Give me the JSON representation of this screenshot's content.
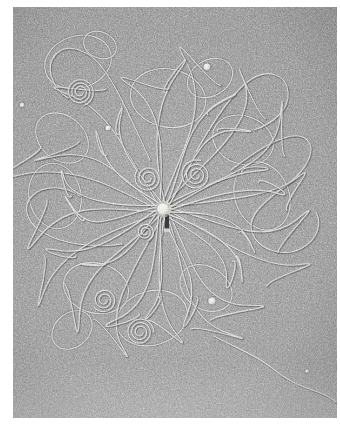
{
  "image": {
    "kind": "transmission-electron-micrograph",
    "subject": "bacteriophage with released DNA",
    "caption": "",
    "width_px": 340,
    "height_px": 426
  },
  "frame": {
    "border_color": "#ffffff",
    "border_left_px": 13,
    "border_top_px": 7,
    "border_right_px": 3,
    "border_bottom_px": 8
  },
  "micrograph": {
    "background_base_color": "#8d8d8d",
    "background_dark_color": "#3a3a3a",
    "background_light_color": "#d8d8d8",
    "filament_color": "#e8e8e8",
    "filament_shadow_color": "#2e2e2e",
    "grain_description": "fine high-contrast stain granularity over carbon support film",
    "vignette_note": "upper-left slightly darker, lower edge slightly lighter"
  },
  "capsid": {
    "label": "phage head",
    "center_x": 163,
    "center_y": 209,
    "radius_px": 6,
    "fill_color": "#f2f0ea",
    "halo_color": "#cfcdc6"
  },
  "tail": {
    "label": "phage tail",
    "x": 167,
    "y_top": 214,
    "y_bottom": 231,
    "width_px": 4,
    "color": "#232323",
    "baseplate_y": 231
  },
  "beads": [
    {
      "name": "latex-bead-upper-right",
      "cx": 207,
      "cy": 67,
      "r": 3.4,
      "color": "#f0eee8"
    },
    {
      "name": "latex-bead-mid-left",
      "cx": 108,
      "cy": 128,
      "r": 2.6,
      "color": "#e8e6e0"
    },
    {
      "name": "latex-bead-lower-right",
      "cx": 212,
      "cy": 301,
      "r": 3.6,
      "color": "#efede6"
    },
    {
      "name": "latex-bead-far-left",
      "cx": 22,
      "cy": 105,
      "r": 2.2,
      "color": "#dedcd6"
    },
    {
      "name": "speck-bottom-right",
      "cx": 307,
      "cy": 371,
      "r": 1.8,
      "color": "#e2e0da"
    }
  ],
  "dna": {
    "label": "released double-stranded DNA",
    "strand_width_px": 1.15,
    "strand_count": 44,
    "description": "long duplex fibres radiating from the capsid, forming open loops, sweeping arcs and tight coils",
    "radial_strands": [
      {
        "a": 268,
        "len": 150,
        "curl": 58,
        "wob": 16
      },
      {
        "a": 282,
        "len": 131,
        "curl": -44,
        "wob": 13
      },
      {
        "a": 294,
        "len": 160,
        "curl": 62,
        "wob": 18
      },
      {
        "a": 305,
        "len": 118,
        "curl": -36,
        "wob": 11
      },
      {
        "a": 315,
        "len": 147,
        "curl": 50,
        "wob": 15
      },
      {
        "a": 326,
        "len": 108,
        "curl": -52,
        "wob": 12
      },
      {
        "a": 337,
        "len": 140,
        "curl": 40,
        "wob": 14
      },
      {
        "a": 348,
        "len": 96,
        "curl": -30,
        "wob": 10
      },
      {
        "a": 357,
        "len": 128,
        "curl": 55,
        "wob": 16
      },
      {
        "a": 6,
        "len": 112,
        "curl": -46,
        "wob": 12
      },
      {
        "a": 16,
        "len": 152,
        "curl": 48,
        "wob": 17
      },
      {
        "a": 27,
        "len": 90,
        "curl": -34,
        "wob": 10
      },
      {
        "a": 37,
        "len": 126,
        "curl": 60,
        "wob": 15
      },
      {
        "a": 47,
        "len": 104,
        "curl": -42,
        "wob": 12
      },
      {
        "a": 57,
        "len": 138,
        "curl": 44,
        "wob": 16
      },
      {
        "a": 67,
        "len": 86,
        "curl": -56,
        "wob": 11
      },
      {
        "a": 77,
        "len": 120,
        "curl": 38,
        "wob": 13
      },
      {
        "a": 87,
        "len": 100,
        "curl": -48,
        "wob": 12
      },
      {
        "a": 97,
        "len": 142,
        "curl": 52,
        "wob": 17
      },
      {
        "a": 108,
        "len": 94,
        "curl": -32,
        "wob": 10
      },
      {
        "a": 118,
        "len": 130,
        "curl": 46,
        "wob": 15
      },
      {
        "a": 128,
        "len": 110,
        "curl": -58,
        "wob": 13
      },
      {
        "a": 139,
        "len": 148,
        "curl": 42,
        "wob": 16
      },
      {
        "a": 150,
        "len": 88,
        "curl": -38,
        "wob": 10
      },
      {
        "a": 160,
        "len": 124,
        "curl": 54,
        "wob": 14
      },
      {
        "a": 171,
        "len": 102,
        "curl": -44,
        "wob": 12
      },
      {
        "a": 182,
        "len": 136,
        "curl": 48,
        "wob": 16
      },
      {
        "a": 193,
        "len": 92,
        "curl": -50,
        "wob": 11
      },
      {
        "a": 203,
        "len": 118,
        "curl": 36,
        "wob": 13
      },
      {
        "a": 214,
        "len": 106,
        "curl": -54,
        "wob": 12
      },
      {
        "a": 224,
        "len": 144,
        "curl": 50,
        "wob": 17
      },
      {
        "a": 234,
        "len": 84,
        "curl": -30,
        "wob": 10
      },
      {
        "a": 244,
        "len": 122,
        "curl": 58,
        "wob": 14
      },
      {
        "a": 255,
        "len": 98,
        "curl": -40,
        "wob": 11
      }
    ],
    "coils": [
      {
        "name": "coil-upper-left",
        "cx": 80,
        "cy": 92,
        "r0": 3,
        "turns": 3.2,
        "grow": 3.4
      },
      {
        "name": "coil-upper-mid",
        "cx": 148,
        "cy": 178,
        "r0": 3,
        "turns": 2.6,
        "grow": 4.0
      },
      {
        "name": "coil-right-of-head",
        "cx": 196,
        "cy": 175,
        "r0": 3,
        "turns": 2.8,
        "grow": 4.4
      },
      {
        "name": "coil-left-lower",
        "cx": 104,
        "cy": 300,
        "r0": 3,
        "turns": 2.4,
        "grow": 3.8
      },
      {
        "name": "coil-bottom-mid",
        "cx": 140,
        "cy": 332,
        "r0": 3,
        "turns": 3.0,
        "grow": 3.6
      },
      {
        "name": "coil-head-left",
        "cx": 145,
        "cy": 232,
        "r0": 2,
        "turns": 2.2,
        "grow": 3.2
      }
    ],
    "free_loops": [
      {
        "name": "loop-top-left-large",
        "cx": 78,
        "cy": 62,
        "rx": 34,
        "ry": 26,
        "rot": -18
      },
      {
        "name": "loop-top-left-small",
        "cx": 100,
        "cy": 45,
        "rx": 17,
        "ry": 13,
        "rot": 25
      },
      {
        "name": "loop-top-centre",
        "cx": 168,
        "cy": 98,
        "rx": 38,
        "ry": 29,
        "rot": 12
      },
      {
        "name": "loop-top-right",
        "cx": 210,
        "cy": 78,
        "rx": 24,
        "ry": 18,
        "rot": -30
      },
      {
        "name": "loop-left-upper",
        "cx": 62,
        "cy": 138,
        "rx": 29,
        "ry": 22,
        "rot": 40
      },
      {
        "name": "loop-left-mid",
        "cx": 55,
        "cy": 196,
        "rx": 26,
        "ry": 33,
        "rot": -12
      },
      {
        "name": "loop-right-upper",
        "cx": 243,
        "cy": 140,
        "rx": 31,
        "ry": 24,
        "rot": 20
      },
      {
        "name": "loop-right-mid",
        "cx": 262,
        "cy": 196,
        "rx": 27,
        "ry": 35,
        "rot": -22
      },
      {
        "name": "loop-bottom-left",
        "cx": 96,
        "cy": 288,
        "rx": 33,
        "ry": 25,
        "rot": 15
      },
      {
        "name": "loop-bottom-centre",
        "cx": 152,
        "cy": 318,
        "rx": 36,
        "ry": 27,
        "rot": -16
      },
      {
        "name": "loop-bottom-right",
        "cx": 206,
        "cy": 288,
        "rx": 28,
        "ry": 21,
        "rot": 34
      },
      {
        "name": "loop-lower-left-far",
        "cx": 72,
        "cy": 330,
        "rx": 22,
        "ry": 17,
        "rot": -40
      }
    ],
    "long_trails": [
      {
        "name": "trail-right-sweep",
        "d": "M 231 170 C 262 146, 292 128, 306 139 C 318 149, 306 170, 288 184 C 266 200, 246 216, 252 232"
      },
      {
        "name": "trail-right-lower",
        "d": "M 252 232 C 258 250, 284 258, 302 248 C 318 239, 322 224, 316 212"
      },
      {
        "name": "trail-bottom-right",
        "d": "M 214 336 C 240 350, 258 356, 272 368 C 286 380, 300 386, 318 392 C 326 395, 332 398, 336 402"
      },
      {
        "name": "trail-left-sweep",
        "d": "M 122 244 C 92 248, 62 244, 42 232 C 26 222, 22 206, 32 196 C 44 184, 66 186, 80 196"
      },
      {
        "name": "trail-top-sweep",
        "d": "M 150 160 C 134 126, 120 92, 104 70 C 90 50, 68 42, 56 54 C 44 66, 52 88, 68 98"
      },
      {
        "name": "trail-upper-right",
        "d": "M 196 152 C 214 120, 232 92, 250 80 C 268 68, 286 74, 288 92 C 290 110, 272 124, 254 130"
      }
    ]
  }
}
